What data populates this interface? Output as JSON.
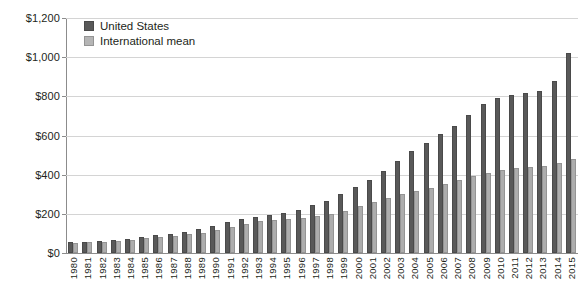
{
  "chart_data": {
    "type": "bar",
    "title": "",
    "subtitle": "",
    "xlabel": "",
    "ylabel": "",
    "ylim": [
      0,
      1200
    ],
    "ytick_labels": [
      "$0",
      "$200",
      "$400",
      "$600",
      "$800",
      "$1,000",
      "$1,200"
    ],
    "ytick_values": [
      0,
      200,
      400,
      600,
      800,
      1000,
      1200
    ],
    "grid": "horizontal",
    "legend_position": "top-left",
    "categories": [
      "1980",
      "1981",
      "1982",
      "1983",
      "1984",
      "1985",
      "1986",
      "1987",
      "1988",
      "1989",
      "1990",
      "1991",
      "1992",
      "1993",
      "1994",
      "1995",
      "1996",
      "1997",
      "1998",
      "1999",
      "2000",
      "2001",
      "2002",
      "2003",
      "2004",
      "2005",
      "2006",
      "2007",
      "2008",
      "2009",
      "2010",
      "2011",
      "2012",
      "2013",
      "2014",
      "2015"
    ],
    "series": [
      {
        "name": "United States",
        "color": "#595959",
        "values": [
          55,
          58,
          63,
          68,
          74,
          82,
          90,
          98,
          108,
          122,
          140,
          158,
          172,
          184,
          192,
          205,
          222,
          243,
          268,
          300,
          335,
          372,
          420,
          470,
          520,
          560,
          610,
          650,
          705,
          760,
          790,
          805,
          815,
          825,
          880,
          1020
        ]
      },
      {
        "name": "International mean",
        "color": "#adadad",
        "values": [
          52,
          55,
          58,
          62,
          68,
          75,
          82,
          88,
          95,
          102,
          118,
          132,
          150,
          163,
          170,
          175,
          180,
          188,
          200,
          215,
          238,
          262,
          280,
          300,
          318,
          330,
          350,
          372,
          392,
          408,
          422,
          432,
          438,
          442,
          460,
          480
        ]
      }
    ]
  },
  "legend": {
    "items": [
      {
        "label": "United States"
      },
      {
        "label": "International mean"
      }
    ]
  }
}
